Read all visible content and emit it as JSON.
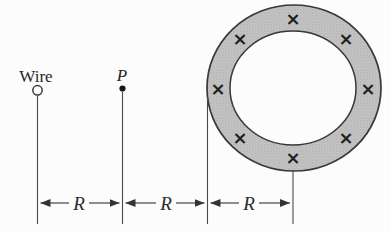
{
  "figure": {
    "background_color": "#fcfcfc",
    "ink_color": "#3a3a3a",
    "ring_fill_color": "#c6c6c6",
    "ring_stipple_color": "#999999",
    "labels": {
      "wire": "Wire",
      "point": "P",
      "dim_wire_to_p": "R",
      "dim_p_to_ring": "R",
      "dim_ring_radius": "R"
    },
    "icons": {
      "field_into_page_marker": "×",
      "field_marker_count": 8
    }
  }
}
